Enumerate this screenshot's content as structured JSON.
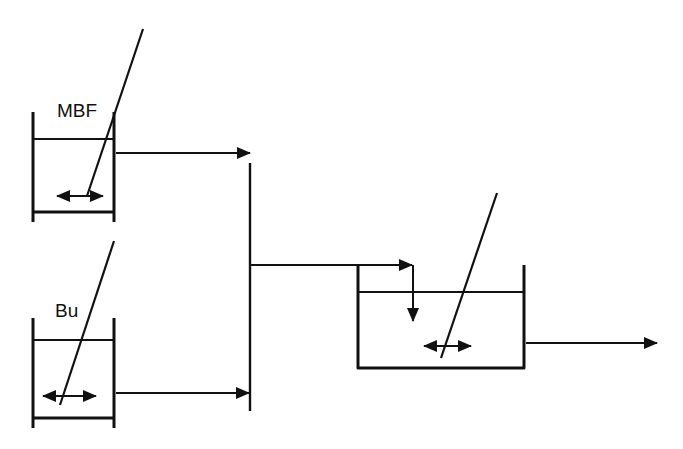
{
  "diagram": {
    "type": "process-flow",
    "colors": {
      "stroke": "#111111",
      "background": "#ffffff"
    },
    "vessels": [
      {
        "id": "mbf-tank",
        "label": "MBF",
        "has_stirrer": true
      },
      {
        "id": "bu-tank",
        "label": "Bu",
        "has_stirrer": true
      },
      {
        "id": "reactor",
        "label": "",
        "has_stirrer": true
      }
    ],
    "flows": [
      {
        "from": "mbf-tank",
        "to": "mixing-junction"
      },
      {
        "from": "bu-tank",
        "to": "mixing-junction"
      },
      {
        "from": "mixing-junction",
        "to": "reactor"
      },
      {
        "from": "reactor",
        "to": "outlet"
      }
    ]
  }
}
